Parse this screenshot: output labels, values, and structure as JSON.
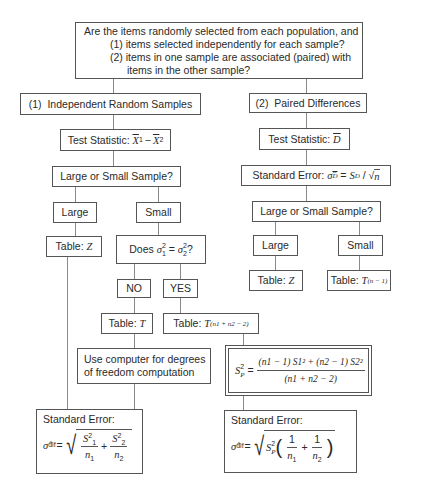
{
  "diagram": {
    "question": {
      "line0": "Are the items randomly selected from each population, and",
      "line1": "(1)  items selected independently for each sample?",
      "line2a": "(2)  items in one sample are associated (paired) with",
      "line2b": "items in the other sample?"
    },
    "left": {
      "branch_title": "(1)  Independent Random Samples",
      "test_statistic_label": "Test Statistic:",
      "test_statistic_formula": "X̄1 − X̄2",
      "sample_size_question": "Large or Small Sample?",
      "large_label": "Large",
      "small_label": "Small",
      "large_table": {
        "label": "Table:",
        "dist": "Z"
      },
      "variance_question": {
        "prefix": "Does",
        "lhs": "σ",
        "lhs_sub": "1",
        "rhs": "σ",
        "rhs_sub": "2",
        "sup": "2",
        "suffix": "?"
      },
      "no_label": "NO",
      "yes_label": "YES",
      "no_table": {
        "label": "Table:",
        "dist": "T"
      },
      "yes_table": {
        "label": "Table:",
        "dist": "T",
        "df": "(n1 + n2 − 2)"
      },
      "computer_note": {
        "line1": "Use computer for degrees",
        "line2": "of freedom computation"
      },
      "pooled_variance": {
        "lhs": "S",
        "lhs_sub": "P",
        "numerator": "(n1 − 1) S1² + (n2 − 1) S2²",
        "denominator": "(n1 + n2 − 2)"
      },
      "standard_error_unpooled": {
        "label": "Standard Error:",
        "symbol": "σ̂",
        "symbol_sub": "dif",
        "formula": "√(S1²/n1 + S2²/n2)"
      },
      "standard_error_pooled": {
        "label": "Standard Error:",
        "symbol": "σ̂",
        "symbol_sub": "dif",
        "formula": "√(SP² (1/n1 + 1/n2))"
      }
    },
    "right": {
      "branch_title": "(2)  Paired Differences",
      "test_statistic_label": "Test Statistic:",
      "test_statistic_formula": "D̄",
      "standard_error": {
        "label": "Standard Error:",
        "formula": "σ̂D̄ = SD / √n"
      },
      "sample_size_question": "Large or Small Sample?",
      "large_label": "Large",
      "small_label": "Small",
      "large_table": {
        "label": "Table:",
        "dist": "Z"
      },
      "small_table": {
        "label": "Table:",
        "dist": "T",
        "df": "(n − 1)"
      }
    },
    "symbols": {
      "equals": "=",
      "plus": "+",
      "minus": "−",
      "one": "1",
      "two": "2",
      "n": "n",
      "S": "S",
      "X": "X",
      "D": "D",
      "slash": "/"
    }
  }
}
